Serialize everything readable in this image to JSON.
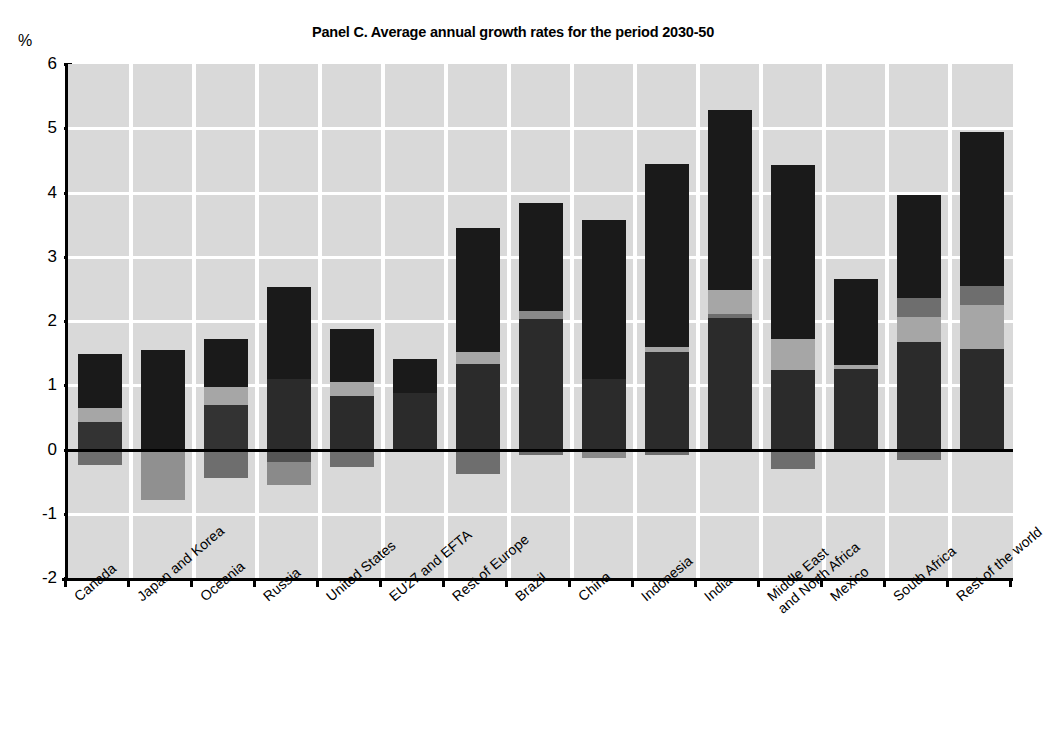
{
  "chart_data": {
    "type": "bar",
    "title": "Panel C. Average annual growth rates for the period 2030-50",
    "xlabel": "",
    "ylabel": "%",
    "ylim": [
      -2,
      6
    ],
    "yticks": [
      6,
      5,
      4,
      3,
      2,
      1,
      0,
      -1,
      -2
    ],
    "grid": true,
    "legend": "none",
    "stacked": true,
    "note": "Stacked contributions; segments may be positive or negative around the zero line.",
    "categories": [
      "Canada",
      "Japan and Korea",
      "Oceania",
      "Russia",
      "United States",
      "EU27 and EFTA",
      "Rest of Europe",
      "Brazil",
      "China",
      "Indonesia",
      "India",
      "Middle East\nand North Africa",
      "Mexico",
      "South Africa",
      "Rest of the world"
    ],
    "totals": [
      1.48,
      1.55,
      1.72,
      2.53,
      1.88,
      1.41,
      3.44,
      3.83,
      3.57,
      4.44,
      5.28,
      4.43,
      2.66,
      3.96,
      4.94
    ],
    "series": [
      {
        "name": "segment-1",
        "color": "#1a1a1a",
        "values": [
          0.45,
          1.3,
          0.43,
          1.1,
          0.83,
          0.88,
          1.33,
          2.03,
          1.09,
          1.52,
          2.05,
          1.24,
          1.25,
          1.68,
          1.57
        ]
      },
      {
        "name": "segment-2",
        "color": "#a6a6a6",
        "values": [
          0.2,
          0.0,
          0.55,
          0.0,
          0.22,
          0.0,
          0.18,
          0.12,
          0.0,
          0.07,
          0.37,
          0.48,
          0.06,
          0.38,
          0.68
        ]
      },
      {
        "name": "segment-3",
        "color": "#6e6e6e",
        "values": [
          0.0,
          0.0,
          0.0,
          0.0,
          0.0,
          0.0,
          0.0,
          0.0,
          0.0,
          0.0,
          0.06,
          0.0,
          0.0,
          0.3,
          0.3
        ]
      },
      {
        "name": "segment-4",
        "color": "#1a1a1a",
        "values": [
          0.83,
          0.25,
          0.74,
          1.43,
          0.83,
          0.53,
          1.93,
          1.68,
          2.48,
          2.85,
          2.8,
          2.71,
          1.35,
          1.6,
          2.39
        ]
      },
      {
        "name": "segment-negative",
        "color": "#6e6e6e",
        "values": [
          -0.24,
          -0.79,
          -0.44,
          -0.56,
          -0.27,
          0.0,
          -0.38,
          -0.09,
          -0.13,
          -0.08,
          0.0,
          -0.3,
          0.0,
          -0.17,
          0.0
        ]
      }
    ],
    "bar_geometry": [
      {
        "category": "Canada",
        "stack_top": 1.48,
        "bands": [
          [
            0.65,
            1.48,
            "#1a1a1a"
          ],
          [
            0.43,
            0.65,
            "#a6a6a6"
          ],
          [
            0.0,
            0.43,
            "#333333"
          ],
          [
            -0.24,
            0.0,
            "#6e6e6e"
          ]
        ]
      },
      {
        "category": "Japan and Korea",
        "stack_top": 1.55,
        "bands": [
          [
            0.0,
            1.55,
            "#1a1a1a"
          ],
          [
            -0.79,
            0.0,
            "#909090"
          ]
        ]
      },
      {
        "category": "Oceania",
        "stack_top": 1.72,
        "bands": [
          [
            0.98,
            1.72,
            "#1a1a1a"
          ],
          [
            0.7,
            0.98,
            "#a6a6a6"
          ],
          [
            0.0,
            0.7,
            "#333333"
          ],
          [
            -0.44,
            0.0,
            "#6e6e6e"
          ]
        ]
      },
      {
        "category": "Russia",
        "stack_top": 2.53,
        "bands": [
          [
            1.1,
            2.53,
            "#1a1a1a"
          ],
          [
            0.0,
            1.1,
            "#2b2b2b"
          ],
          [
            -0.19,
            0.0,
            "#555555"
          ],
          [
            -0.56,
            -0.19,
            "#8a8a8a"
          ]
        ]
      },
      {
        "category": "United States",
        "stack_top": 1.88,
        "bands": [
          [
            1.05,
            1.88,
            "#1a1a1a"
          ],
          [
            0.83,
            1.05,
            "#a6a6a6"
          ],
          [
            0.0,
            0.83,
            "#2b2b2b"
          ],
          [
            -0.27,
            0.0,
            "#6e6e6e"
          ]
        ]
      },
      {
        "category": "EU27 and EFTA",
        "stack_top": 1.41,
        "bands": [
          [
            0.88,
            1.41,
            "#1a1a1a"
          ],
          [
            0.0,
            0.88,
            "#2b2b2b"
          ]
        ]
      },
      {
        "category": "Rest of Europe",
        "stack_top": 3.44,
        "bands": [
          [
            1.51,
            3.44,
            "#1a1a1a"
          ],
          [
            1.33,
            1.51,
            "#a6a6a6"
          ],
          [
            0.0,
            1.33,
            "#2b2b2b"
          ],
          [
            -0.38,
            0.0,
            "#6e6e6e"
          ]
        ]
      },
      {
        "category": "Brazil",
        "stack_top": 3.83,
        "bands": [
          [
            2.15,
            3.83,
            "#1a1a1a"
          ],
          [
            2.03,
            2.15,
            "#8a8a8a"
          ],
          [
            0.0,
            2.03,
            "#2b2b2b"
          ],
          [
            -0.09,
            0.0,
            "#6e6e6e"
          ]
        ]
      },
      {
        "category": "China",
        "stack_top": 3.57,
        "bands": [
          [
            1.09,
            3.57,
            "#1a1a1a"
          ],
          [
            0.0,
            1.09,
            "#2b2b2b"
          ],
          [
            -0.13,
            0.0,
            "#8a8a8a"
          ]
        ]
      },
      {
        "category": "Indonesia",
        "stack_top": 4.44,
        "bands": [
          [
            1.59,
            4.44,
            "#1a1a1a"
          ],
          [
            1.52,
            1.59,
            "#a6a6a6"
          ],
          [
            0.0,
            1.52,
            "#2b2b2b"
          ],
          [
            -0.08,
            0.0,
            "#6e6e6e"
          ]
        ]
      },
      {
        "category": "India",
        "stack_top": 5.28,
        "bands": [
          [
            2.48,
            5.28,
            "#1a1a1a"
          ],
          [
            2.11,
            2.48,
            "#a6a6a6"
          ],
          [
            2.05,
            2.11,
            "#6e6e6e"
          ],
          [
            0.0,
            2.05,
            "#2b2b2b"
          ]
        ]
      },
      {
        "category": "Middle East and North Africa",
        "stack_top": 4.43,
        "bands": [
          [
            1.72,
            4.43,
            "#1a1a1a"
          ],
          [
            1.24,
            1.72,
            "#a6a6a6"
          ],
          [
            0.0,
            1.24,
            "#2b2b2b"
          ],
          [
            -0.3,
            0.0,
            "#6e6e6e"
          ]
        ]
      },
      {
        "category": "Mexico",
        "stack_top": 2.66,
        "bands": [
          [
            1.31,
            2.66,
            "#1a1a1a"
          ],
          [
            1.25,
            1.31,
            "#a6a6a6"
          ],
          [
            0.0,
            1.25,
            "#2b2b2b"
          ]
        ]
      },
      {
        "category": "South Africa",
        "stack_top": 3.96,
        "bands": [
          [
            2.36,
            3.96,
            "#1a1a1a"
          ],
          [
            2.06,
            2.36,
            "#6e6e6e"
          ],
          [
            1.68,
            2.06,
            "#a6a6a6"
          ],
          [
            0.0,
            1.68,
            "#2b2b2b"
          ],
          [
            -0.17,
            0.0,
            "#6e6e6e"
          ]
        ]
      },
      {
        "category": "Rest of the world",
        "stack_top": 4.94,
        "bands": [
          [
            2.55,
            4.94,
            "#1a1a1a"
          ],
          [
            2.25,
            2.55,
            "#6e6e6e"
          ],
          [
            1.57,
            2.25,
            "#a6a6a6"
          ],
          [
            0.0,
            1.57,
            "#2b2b2b"
          ]
        ]
      }
    ]
  },
  "colors": {
    "plot_background": "#d9d9d9",
    "gridline": "#ffffff",
    "axis": "#000000",
    "dark": "#1a1a1a",
    "mid_dark": "#2b2b2b",
    "mid_gray": "#6e6e6e",
    "light_gray": "#a6a6a6"
  }
}
